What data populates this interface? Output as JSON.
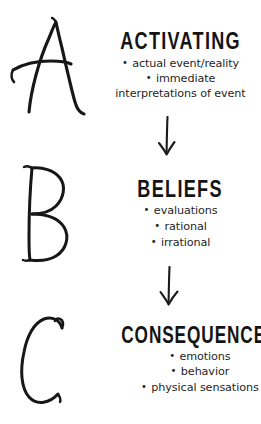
{
  "diagram": {
    "background_color": "#ffffff",
    "ink_color": "#1a1a1a",
    "blocks": [
      {
        "letter": "A",
        "heading": "ACTIVATING",
        "bullets": [
          "actual event/reality",
          "immediate",
          "interpretations of event"
        ]
      },
      {
        "letter": "B",
        "heading": "BELIEFS",
        "bullets": [
          "evaluations",
          "rational",
          "irrational"
        ]
      },
      {
        "letter": "C",
        "heading": "CONSEQUENCES",
        "bullets": [
          "emotions",
          "behavior",
          "physical sensations"
        ]
      }
    ],
    "bullet_glyph": "•",
    "connectors": [
      {
        "name": "arrow-a-to-b",
        "direction": "down"
      },
      {
        "name": "arrow-b-to-c",
        "direction": "down"
      }
    ]
  }
}
